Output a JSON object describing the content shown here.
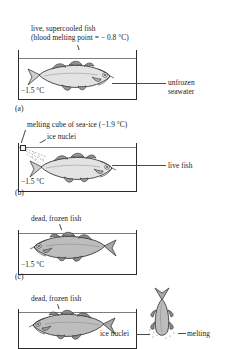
{
  "figure": {
    "name": "fish-supercooling-seawater-experiment",
    "panels": [
      {
        "id": "(a)",
        "caption_line1": "live, supercooled fish",
        "caption_line2": "(blood melting point = − 0.8 °C)",
        "temperature": "−1.5 °C",
        "right_label_line1": "unfrozen",
        "right_label_line2": "seawater",
        "fish_state": "live-supercooled",
        "fish_direction": "right",
        "fish_fill": "#e3e3e3"
      },
      {
        "id": "(b)",
        "caption_line1": "melting cube of sea-ice (−1.9 °C)",
        "caption_line2": "ice nuclei",
        "temperature": "−1.5 °C",
        "right_label_line1": "live fish",
        "fish_state": "live",
        "fish_direction": "right",
        "fish_fill": "#e3e3e3"
      },
      {
        "id": "(c)",
        "caption_line1": "dead, frozen fish",
        "temperature": "−1.5 °C",
        "fish_state": "dead-frozen",
        "fish_direction": "left",
        "fish_fill": "#bdbdbd"
      },
      {
        "id": "(d)",
        "caption_line1": "dead, frozen fish",
        "caption_line2": "ice nuclei",
        "right_label_line1": "melting",
        "fish_state": "dead-frozen",
        "fish_direction": "left",
        "fish_fill": "#bdbdbd",
        "vertical_fish_state": "melting-vertical"
      }
    ],
    "colors": {
      "outline": "#2b2b2b",
      "waterline": "#7d7d7d",
      "fish_light": "#e3e3e3",
      "fish_dark": "#bdbdbd",
      "fin_shade": "#9a9a9a",
      "leader": "#4a4a4a",
      "background": "#ffffff"
    }
  }
}
